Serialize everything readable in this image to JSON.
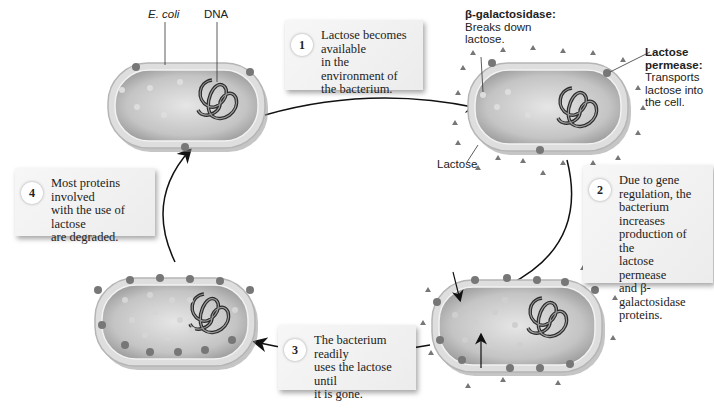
{
  "diagram": {
    "labels": {
      "ecoli": "E. coli",
      "dna": "DNA",
      "beta_gal_title": "β-galactosidase:",
      "beta_gal_desc1": "Breaks down",
      "beta_gal_desc2": "lactose.",
      "permease_title1": "Lactose",
      "permease_title2": "permease:",
      "permease_desc1": "Transports",
      "permease_desc2": "lactose into",
      "permease_desc3": "the cell.",
      "lactose": "Lactose"
    },
    "steps": [
      {
        "number": "1",
        "lines": [
          "Lactose becomes available",
          "in the environment of",
          "the bacterium."
        ]
      },
      {
        "number": "2",
        "lines": [
          "Due to gene",
          "regulation, the",
          "bacterium increases",
          "production of the",
          "lactose permease",
          "and β-galactosidase",
          "proteins."
        ]
      },
      {
        "number": "3",
        "lines": [
          "The bacterium readily",
          "uses the lactose until",
          "it is gone."
        ]
      },
      {
        "number": "4",
        "lines": [
          "Most proteins involved",
          "with the use of lactose",
          "are degraded."
        ]
      }
    ],
    "colors": {
      "cell_fill": "#c9c9c9",
      "cell_membrane": "#e3e3e3",
      "dna": "#2b2b2b",
      "arrow": "#111111",
      "box_bg": "#efefef"
    }
  }
}
